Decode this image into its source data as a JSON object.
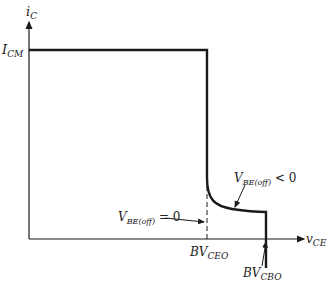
{
  "diagram": {
    "type": "transistor safe operating area / breakdown characteristic",
    "y_axis": {
      "label_main": "i",
      "label_sub": "C"
    },
    "x_axis": {
      "label_main": "v",
      "label_sub": "CE"
    },
    "icm_label": {
      "main": "I",
      "sub": "CM"
    },
    "bvceo_label": {
      "main": "BV",
      "sub": "CEO"
    },
    "bvcbo_label": {
      "main": "BV",
      "sub": "CBO"
    },
    "annotation_zero": {
      "main": "V",
      "sub": "BE(off)",
      "rest": " = 0"
    },
    "annotation_neg": {
      "main": "V",
      "sub": "BE(off)",
      "rest": " < 0"
    },
    "colors": {
      "line": "#1a1a1a",
      "text": "#222222"
    }
  }
}
